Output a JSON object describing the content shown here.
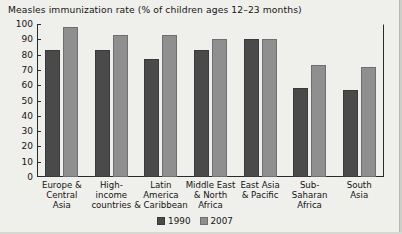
{
  "chart_data": {
    "type": "bar",
    "title": "Measles immunization rate (% of children ages 12–23 months)",
    "xlabel": "",
    "ylabel": "",
    "ylim": [
      0,
      100
    ],
    "ytick_step": 10,
    "yticks": [
      "0",
      "10",
      "20",
      "30",
      "40",
      "50",
      "60",
      "70",
      "80",
      "90",
      "100"
    ],
    "grid": false,
    "legend_position": "bottom-center",
    "categories": [
      "Europe & Central Asia",
      "High-income countries",
      "Latin America & Caribbean",
      "Middle East & North Africa",
      "East Asia & Pacific",
      "Sub-Saharan Africa",
      "South Asia"
    ],
    "category_lines": [
      [
        "Europe &",
        "Central",
        "Asia"
      ],
      [
        "High-",
        "income",
        "countries"
      ],
      [
        "Latin",
        "America",
        "& Caribbean"
      ],
      [
        "Middle East",
        "& North",
        "Africa"
      ],
      [
        "East Asia",
        "& Pacific"
      ],
      [
        "Sub-",
        "Saharan",
        "Africa"
      ],
      [
        "South",
        "Asia"
      ]
    ],
    "series": [
      {
        "name": "1990",
        "color": "#4a4a4a",
        "values": [
          83,
          83,
          77,
          83,
          90,
          58,
          57
        ]
      },
      {
        "name": "2007",
        "color": "#8f8f8f",
        "values": [
          98,
          93,
          93,
          90,
          90,
          73,
          72
        ]
      }
    ]
  },
  "legend": {
    "items": [
      {
        "label": "1990"
      },
      {
        "label": "2007"
      }
    ]
  },
  "colors": {
    "series_1990": "#4a4a4a",
    "series_2007": "#8f8f8f",
    "axis": "#2a2a2a",
    "background": "#efefeb",
    "text": "#151515"
  }
}
